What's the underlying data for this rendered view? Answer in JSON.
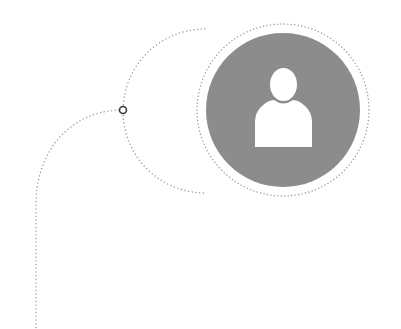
{
  "diagram": {
    "type": "connector-node",
    "colors": {
      "background": "#ffffff",
      "avatar_fill": "#8c8c8c",
      "avatar_glyph": "#ffffff",
      "dotted_line": "#9a9a9a",
      "node_stroke": "#3a3a3a"
    },
    "avatar": {
      "icon": "user-icon",
      "cx": 283,
      "cy": 110,
      "r": 77,
      "ring_r": 86
    },
    "node": {
      "cx": 123,
      "cy": 110,
      "r": 3.5
    }
  }
}
